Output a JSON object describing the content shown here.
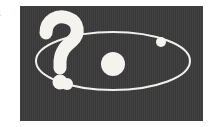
{
  "page": {
    "background_color": "#ffffff",
    "width": 209,
    "height": 127
  },
  "margin_text": {
    "line_1": "n",
    "line_2": "t"
  },
  "figure": {
    "name": "orbit-question-illustration",
    "panel": {
      "background_color": "#3b3b3b",
      "x": 20,
      "y": 6,
      "width": 183,
      "height": 115
    },
    "ink_color": "#f2f0ec",
    "orbit": {
      "label": "elliptical-orbit",
      "center_x": 113,
      "center_y": 61,
      "radius_x": 77,
      "radius_y": 29,
      "stroke_width": 2
    },
    "central_body": {
      "label": "central-star",
      "center_x": 113,
      "center_y": 64,
      "radius": 12
    },
    "orbiting_bodies": [
      {
        "label": "orbiting-body-upper-right",
        "center_x": 161,
        "center_y": 42,
        "radius": 5
      },
      {
        "label": "orbiting-body-lower-left",
        "center_x": 67,
        "center_y": 84,
        "radius": 6
      }
    ],
    "question_mark": {
      "label": "question-mark-glyph",
      "character": "?",
      "x": 63,
      "y": 58,
      "font_size": 76
    }
  }
}
